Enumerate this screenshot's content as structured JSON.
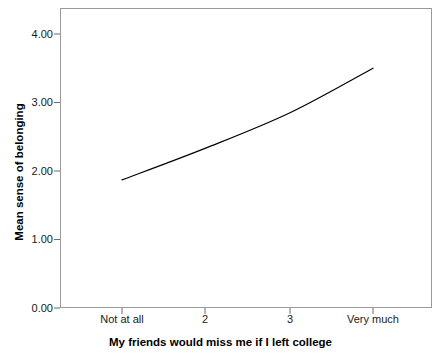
{
  "chart_data": {
    "type": "line",
    "title": "",
    "subtitle": "",
    "xlabel": "My friends would miss me if I left college",
    "ylabel": "Mean sense of belonging",
    "categories": [
      "Not at all",
      "2",
      "3",
      "Very much"
    ],
    "values": [
      1.87,
      2.33,
      2.85,
      3.5
    ],
    "series": [
      {
        "name": "Mean sense of belonging",
        "values": [
          1.87,
          2.33,
          2.85,
          3.5
        ]
      }
    ],
    "ylim": [
      0.0,
      4.35
    ],
    "yticks": [
      0.0,
      1.0,
      2.0,
      3.0,
      4.0
    ],
    "ytick_labels": [
      "0.00",
      "1.00",
      "2.00",
      "3.00",
      "4.00"
    ],
    "xtick_labels": [
      "Not at all",
      "2",
      "3",
      "Very much"
    ],
    "grid": false,
    "legend": false,
    "legend_position": "none",
    "line_color": "#000000",
    "frame_color": "#9a9a9a",
    "background_color": "#ffffff",
    "annotations": []
  },
  "axes": {
    "y_title": "Mean sense of belonging",
    "x_title": "My friends would miss me if I left college"
  }
}
